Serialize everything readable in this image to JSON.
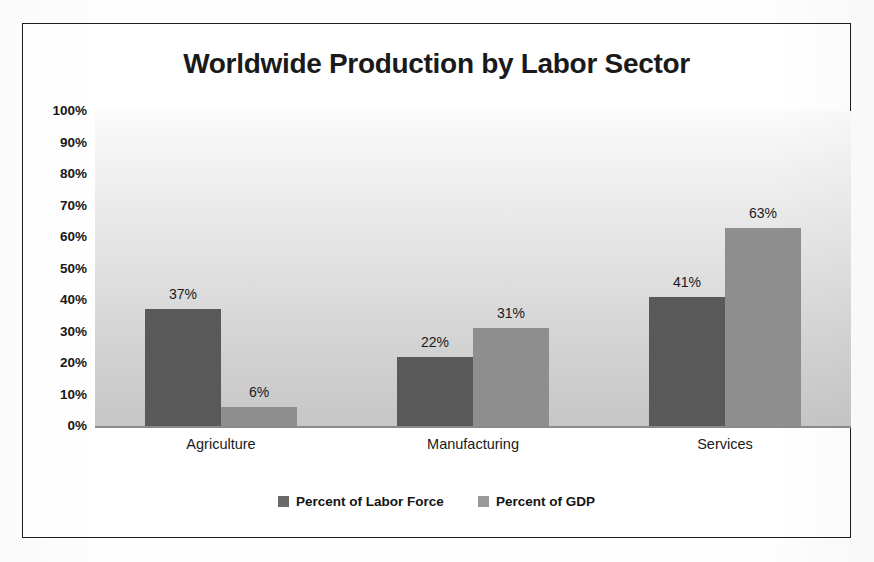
{
  "chart_data": {
    "type": "bar",
    "title": "Worldwide Production by Labor Sector",
    "xlabel": "",
    "ylabel": "",
    "categories": [
      "Agriculture",
      "Manufacturing",
      "Services"
    ],
    "series": [
      {
        "name": "Percent of Labor Force",
        "color": "#595959",
        "values": [
          37,
          22,
          41
        ],
        "labels": [
          "37%",
          "22%",
          "41%"
        ]
      },
      {
        "name": "Percent of GDP",
        "color": "#8e8e8e",
        "values": [
          6,
          31,
          63
        ],
        "labels": [
          "6%",
          "31%",
          "63%"
        ]
      }
    ],
    "ylim": [
      0,
      100
    ],
    "yticks": [
      0,
      10,
      20,
      30,
      40,
      50,
      60,
      70,
      80,
      90,
      100
    ],
    "ytick_labels": [
      "0%",
      "10%",
      "20%",
      "30%",
      "40%",
      "50%",
      "60%",
      "70%",
      "80%",
      "90%",
      "100%"
    ],
    "grid": false,
    "legend_position": "bottom",
    "value_labels_shown": true,
    "plot_background": "vertical gray gradient",
    "frame_border_color": "#1d1d1d"
  }
}
